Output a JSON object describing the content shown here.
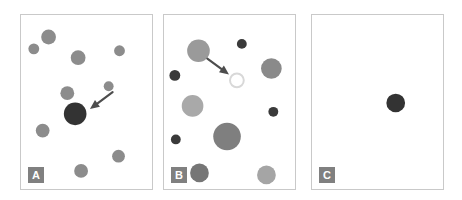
{
  "figure": {
    "width": 462,
    "height": 200,
    "background_color": "#ffffff",
    "panel_border_color": "#c9c9c9",
    "label_badge_color": "#808080",
    "label_text_color": "#ffffff",
    "arrow_color": "#4d4d4d"
  },
  "panels": [
    {
      "id": "A",
      "label": "A",
      "x": 20,
      "y": 14,
      "width": 133,
      "height": 176,
      "label_x": 7,
      "label_y": 152,
      "description": "Dense field of medium gray distractor circles with one large dark target circle indicated by an arrow",
      "distractor_color": "#8c8c8c",
      "target_color": "#333333",
      "circles": [
        {
          "name": "distractor-1",
          "cx": 28,
          "cy": 22,
          "r": 7.5,
          "fill": "#8c8c8c"
        },
        {
          "name": "distractor-2",
          "cx": 100,
          "cy": 36,
          "r": 5.5,
          "fill": "#8c8c8c"
        },
        {
          "name": "distractor-3",
          "cx": 13,
          "cy": 34,
          "r": 5.5,
          "fill": "#8c8c8c"
        },
        {
          "name": "distractor-4",
          "cx": 58,
          "cy": 43,
          "r": 7.5,
          "fill": "#8c8c8c"
        },
        {
          "name": "distractor-5",
          "cx": 47,
          "cy": 79,
          "r": 7.0,
          "fill": "#8c8c8c"
        },
        {
          "name": "distractor-6",
          "cx": 89,
          "cy": 72,
          "r": 5.0,
          "fill": "#8c8c8c"
        },
        {
          "name": "distractor-7",
          "cx": 22,
          "cy": 117,
          "r": 7.0,
          "fill": "#8c8c8c"
        },
        {
          "name": "distractor-8",
          "cx": 99,
          "cy": 143,
          "r": 6.5,
          "fill": "#8c8c8c"
        },
        {
          "name": "distractor-9",
          "cx": 61,
          "cy": 158,
          "r": 7.0,
          "fill": "#8c8c8c"
        },
        {
          "name": "target-circle",
          "cx": 55,
          "cy": 100,
          "r": 11.5,
          "fill": "#333333",
          "is_target": true
        }
      ],
      "arrow": {
        "name": "target-pointer-arrow",
        "x1": 93,
        "y1": 78,
        "x2": 70,
        "y2": 95,
        "points_to": "target-circle"
      }
    },
    {
      "id": "B",
      "label": "B",
      "x": 163,
      "y": 14,
      "width": 133,
      "height": 176,
      "label_x": 7,
      "label_y": 152,
      "description": "Field of variably sized and shaded gray circles with a white outlined target circle indicated by an arrow",
      "target_color": "#ffffff",
      "target_stroke": "#d8d8d8",
      "circles": [
        {
          "name": "distractor-1",
          "cx": 35,
          "cy": 36,
          "r": 11.5,
          "fill": "#9a9a9a"
        },
        {
          "name": "distractor-2",
          "cx": 79,
          "cy": 29,
          "r": 5.0,
          "fill": "#3a3a3a"
        },
        {
          "name": "distractor-3",
          "cx": 109,
          "cy": 54,
          "r": 10.5,
          "fill": "#8a8a8a"
        },
        {
          "name": "distractor-4",
          "cx": 11,
          "cy": 61,
          "r": 5.5,
          "fill": "#3a3a3a"
        },
        {
          "name": "distractor-5",
          "cx": 29,
          "cy": 92,
          "r": 11.0,
          "fill": "#a9a9a9"
        },
        {
          "name": "distractor-6",
          "cx": 111,
          "cy": 98,
          "r": 5.0,
          "fill": "#3a3a3a"
        },
        {
          "name": "distractor-7",
          "cx": 12,
          "cy": 126,
          "r": 5.0,
          "fill": "#3a3a3a"
        },
        {
          "name": "distractor-8",
          "cx": 64,
          "cy": 123,
          "r": 14.0,
          "fill": "#7f7f7f"
        },
        {
          "name": "distractor-9",
          "cx": 36,
          "cy": 160,
          "r": 9.5,
          "fill": "#767676"
        },
        {
          "name": "distractor-10",
          "cx": 104,
          "cy": 162,
          "r": 9.5,
          "fill": "#a5a5a5"
        },
        {
          "name": "target-circle",
          "cx": 74,
          "cy": 66,
          "r": 7.0,
          "fill": "#ffffff",
          "stroke": "#d8d8d8",
          "is_target": true
        }
      ],
      "arrow": {
        "name": "target-pointer-arrow",
        "x1": 44,
        "y1": 44,
        "x2": 66,
        "y2": 60,
        "points_to": "target-circle"
      }
    },
    {
      "id": "C",
      "label": "C",
      "x": 311,
      "y": 14,
      "width": 133,
      "height": 176,
      "label_x": 7,
      "label_y": 152,
      "description": "Empty panel containing only a single isolated dark circle, no distractors and no arrow",
      "target_color": "#333333",
      "circles": [
        {
          "name": "target-circle",
          "cx": 85,
          "cy": 89,
          "r": 9.5,
          "fill": "#333333",
          "is_target": true
        }
      ],
      "arrow": null
    }
  ]
}
